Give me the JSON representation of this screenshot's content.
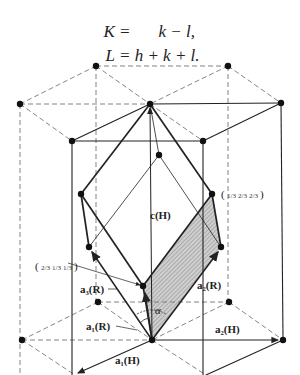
{
  "equations": [
    {
      "lhs": "K =",
      "rhs": "k − l,"
    },
    {
      "lhs": "L =",
      "rhs": "h + k + l."
    }
  ],
  "diagram": {
    "labels": {
      "c_H": "c(H)",
      "a1_H": "a₁(H)",
      "a2_H": "a₂(H)",
      "a1_R": "a₁(R)",
      "a2_R": "a₂(R)",
      "a3_R": "a₃(R)",
      "alpha": "α",
      "point_right": "(1/3 2/3 2/3)",
      "point_left": "(2/3 1/3 1/3)"
    },
    "fractions": {
      "right": [
        "1/3",
        "2/3",
        "2/3"
      ],
      "left": [
        "2/3",
        "1/3",
        "1/3"
      ]
    },
    "colors": {
      "line": "#222222",
      "dashed": "#777777",
      "shade": "#bdbdbd"
    }
  }
}
